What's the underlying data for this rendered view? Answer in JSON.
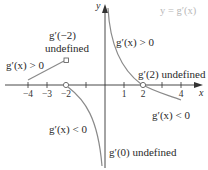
{
  "title": "y = g′(x)",
  "axes": {
    "x_label": "x",
    "y_label": "y",
    "x_ticks": [
      "−4",
      "−3",
      "−2",
      "1",
      "2",
      "4"
    ]
  },
  "annotations": {
    "neg2_line1": "g′(−2)",
    "neg2_line2": "undefined",
    "left_positive": "g′(x) > 0",
    "upper_right_positive": "g′(x) > 0",
    "pos2_undefined": "g′(2) undefined",
    "right_negative": "g′(x) < 0",
    "left_negative": "g′(x) < 0",
    "zero_undefined": "g′(0) undefined"
  },
  "colors": {
    "axis": "#333333",
    "curve": "#8a8a8a",
    "title": "#b8b8b8"
  }
}
